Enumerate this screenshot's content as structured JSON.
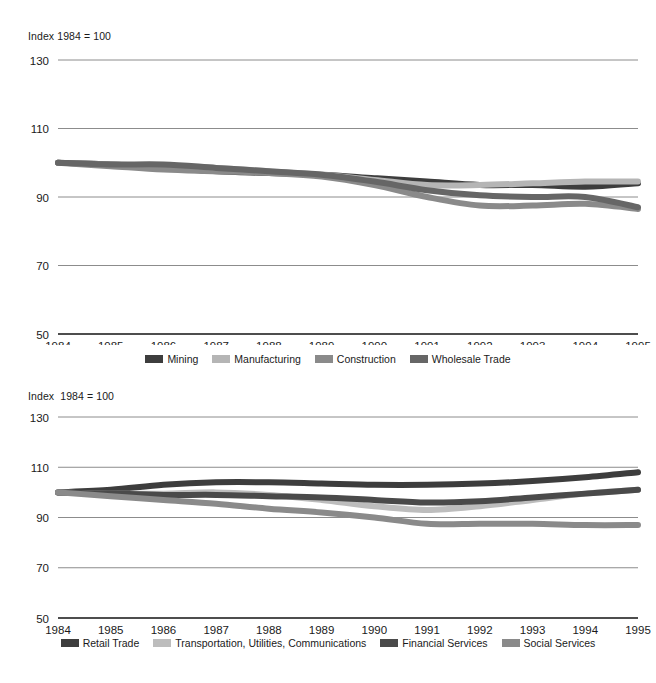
{
  "charts": [
    {
      "id": "top",
      "index_note": "Index 1984 = 100",
      "chart_data": {
        "type": "line",
        "title": "",
        "subtitle": "Index 1984 = 100",
        "xlabel": "",
        "ylabel": "",
        "x": [
          1984,
          1985,
          1986,
          1987,
          1988,
          1989,
          1990,
          1991,
          1992,
          1993,
          1994,
          1995
        ],
        "categories": [
          "1984",
          "1985",
          "1986",
          "1987",
          "1988",
          "1989",
          "1990",
          "1991",
          "1992",
          "1993",
          "1994",
          "1995"
        ],
        "xlim": [
          1984,
          1995
        ],
        "ylim": [
          50,
          130
        ],
        "yticks": [
          50,
          70,
          90,
          110,
          130
        ],
        "grid": true,
        "legend_position": "bottom",
        "series": [
          {
            "name": "Mining",
            "color": "#3d3d3d",
            "values": [
              100,
              99.5,
              98.5,
              97.5,
              97,
              96.5,
              95.5,
              94.5,
              93.5,
              93.5,
              93,
              94
            ]
          },
          {
            "name": "Manufacturing",
            "color": "#b5b5b5",
            "values": [
              100,
              99.5,
              99,
              98.5,
              97.5,
              96.5,
              95,
              93.5,
              93.5,
              94,
              94.5,
              94.5
            ]
          },
          {
            "name": "Construction",
            "color": "#8a8a8a",
            "values": [
              100,
              99,
              98,
              97.5,
              97,
              96,
              93.5,
              90,
              87.5,
              87.5,
              88,
              86.5
            ]
          },
          {
            "name": "Wholesale Trade",
            "color": "#666666",
            "values": [
              100,
              99.5,
              99.5,
              98.5,
              97.5,
              96.5,
              94.5,
              92,
              90.5,
              90,
              90,
              87
            ]
          }
        ]
      }
    },
    {
      "id": "bottom",
      "index_note": "Index  1984 = 100",
      "chart_data": {
        "type": "line",
        "title": "",
        "subtitle": "Index  1984 = 100",
        "xlabel": "",
        "ylabel": "",
        "x": [
          1984,
          1985,
          1986,
          1987,
          1988,
          1989,
          1990,
          1991,
          1992,
          1993,
          1994,
          1995
        ],
        "categories": [
          "1984",
          "1985",
          "1986",
          "1987",
          "1988",
          "1989",
          "1990",
          "1991",
          "1992",
          "1993",
          "1994",
          "1995"
        ],
        "xlim": [
          1984,
          1995
        ],
        "ylim": [
          50,
          130
        ],
        "yticks": [
          50,
          70,
          90,
          110,
          130
        ],
        "grid": true,
        "legend_position": "bottom",
        "series": [
          {
            "name": "Retail Trade",
            "color": "#3d3d3d",
            "values": [
              100,
              101,
              103,
              104,
              104,
              103.5,
              103,
              103,
              103.5,
              104.5,
              106,
              108
            ]
          },
          {
            "name": "Transportation, Utilities, Communications",
            "color": "#bdbdbd",
            "values": [
              100,
              99.5,
              99.5,
              100,
              99,
              97,
              94.5,
              93,
              94.5,
              97,
              99.5,
              101
            ]
          },
          {
            "name": "Financial Services",
            "color": "#4a4a4a",
            "values": [
              100,
              99.5,
              99,
              99,
              98.5,
              98,
              97,
              96,
              96.5,
              98,
              99.5,
              101
            ]
          },
          {
            "name": "Social Services",
            "color": "#8a8a8a",
            "values": [
              100,
              98.5,
              97,
              95.5,
              93.5,
              92,
              90,
              87.5,
              87.5,
              87.5,
              87,
              87
            ]
          }
        ]
      }
    }
  ]
}
